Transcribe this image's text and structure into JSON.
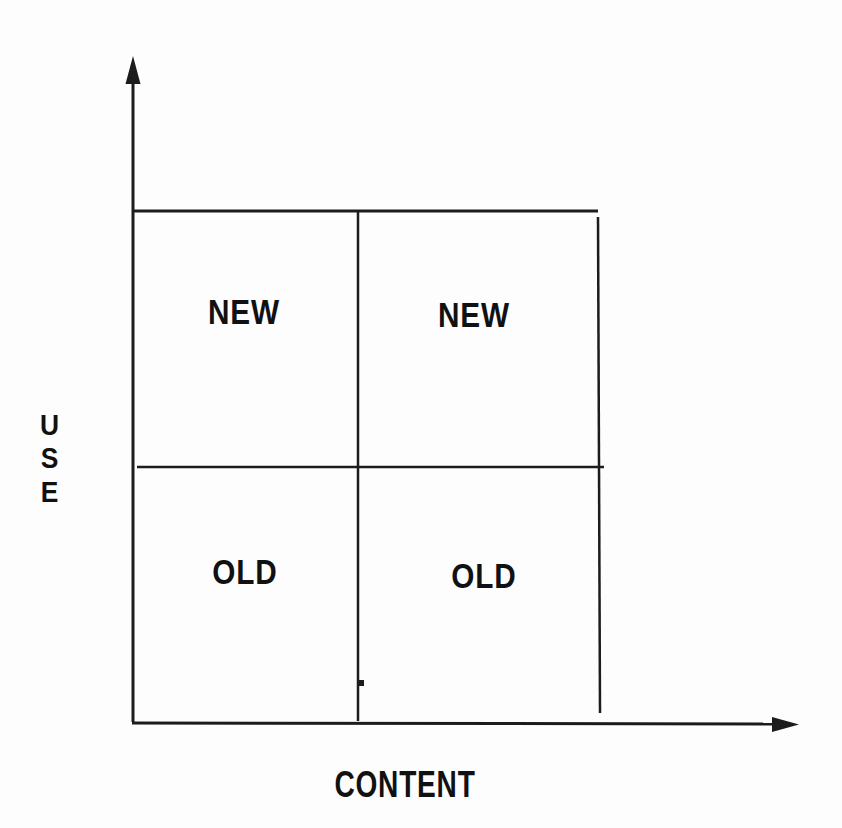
{
  "colors": {
    "line": "#1c1c1c",
    "text": "#111111",
    "background": "#fdfdfd"
  },
  "diagram": {
    "type": "quadrant-matrix",
    "x_axis_label": "CONTENT",
    "y_axis_label": "USE",
    "quadrants": [
      {
        "position": "top-left",
        "label": "NEW"
      },
      {
        "position": "top-right",
        "label": "NEW"
      },
      {
        "position": "bottom-left",
        "label": "OLD"
      },
      {
        "position": "bottom-right",
        "label": "OLD"
      }
    ]
  }
}
